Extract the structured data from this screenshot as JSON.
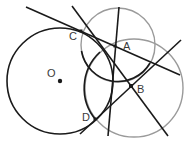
{
  "diagram": {
    "type": "geometry",
    "colors": {
      "black": "#1a1a1a",
      "gray": "#9a9a9a",
      "background": "#ffffff"
    },
    "points": {
      "O": {
        "label": "O",
        "x": 60,
        "y": 81
      },
      "A": {
        "label": "A",
        "x": 115,
        "y": 46
      },
      "B": {
        "label": "B",
        "x": 131,
        "y": 86
      },
      "C": {
        "label": "C",
        "x": 81,
        "y": 31
      },
      "D": {
        "label": "D",
        "x": 95,
        "y": 119
      }
    },
    "circles": [
      {
        "name": "circle-O",
        "cx": 60,
        "cy": 81,
        "r": 53,
        "color": "black"
      },
      {
        "name": "circle-upper",
        "cx": 118,
        "cy": 45,
        "r": 37,
        "color": "gray"
      },
      {
        "name": "circle-lower",
        "cx": 134,
        "cy": 88,
        "r": 49,
        "color": "gray"
      }
    ],
    "lines": [
      {
        "name": "line-CA",
        "x1": 26,
        "y1": 7,
        "x2": 180,
        "y2": 75
      },
      {
        "name": "line-CB",
        "x1": 72,
        "y1": 6,
        "x2": 168,
        "y2": 136
      },
      {
        "name": "line-A-vertical",
        "x1": 119,
        "y1": 7,
        "x2": 108,
        "y2": 136
      },
      {
        "name": "line-BD",
        "x1": 181,
        "y1": 40,
        "x2": 80,
        "y2": 134
      }
    ]
  }
}
